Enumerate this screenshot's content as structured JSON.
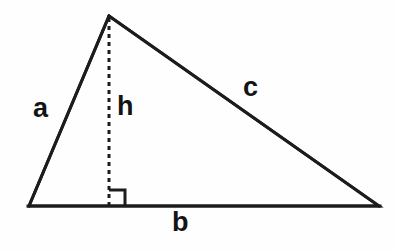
{
  "figure": {
    "name": "right-triangle-with-altitude",
    "background_color": "#fefefe",
    "stroke_color": "#1c1c1c",
    "label_color": "#141414"
  },
  "labels": {
    "side_a": "a",
    "side_b": "b",
    "side_c": "c",
    "altitude_h": "h"
  },
  "geometry": {
    "apex": [
      109,
      16
    ],
    "left_vertex": [
      29,
      206
    ],
    "right_vertex": [
      379,
      206
    ],
    "altitude_foot": [
      109,
      206
    ],
    "right_angle_marker": {
      "corner": [
        109,
        206
      ],
      "size": 16,
      "opens": "right"
    },
    "altitude_line_style": "dashed",
    "outline_line_style": "solid",
    "stroke_width": 3
  }
}
